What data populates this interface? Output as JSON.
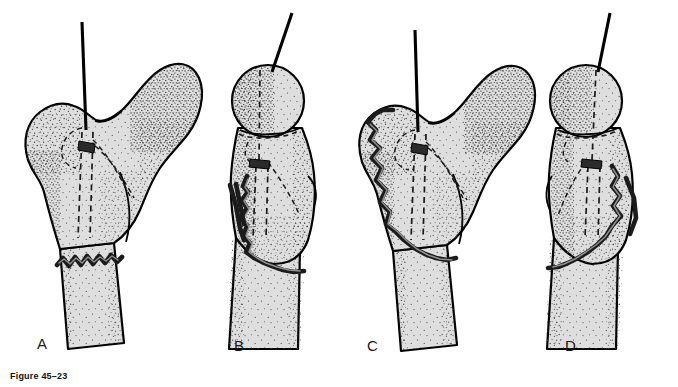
{
  "figure": {
    "caption": "Figure 45–23",
    "background_color": "#ffffff",
    "bone_fill_color": "#dedede",
    "outline_color": "#000000",
    "fracture_color": "#1b1b1b",
    "stipple_color": "#2a2a2a"
  },
  "panels": [
    {
      "id": "a",
      "label": "A",
      "label_x": 37,
      "label_y": 349,
      "view": "anteroposterior",
      "head_side": "right",
      "guide_pin": {
        "x": 82,
        "y_top": 22,
        "y_bottom": 130
      },
      "fracture": {
        "type": "transverse-comminuted",
        "location": "subtrochanteric-shaft"
      }
    },
    {
      "id": "b",
      "label": "B",
      "label_x": 234,
      "label_y": 351,
      "view": "lateral",
      "head_side": "top",
      "guide_pin": {
        "x": 292,
        "y_top": 13,
        "y_bottom": 78
      },
      "fracture": {
        "type": "oblique-comminuted",
        "location": "medial-subtrochanteric"
      }
    },
    {
      "id": "c",
      "label": "C",
      "label_x": 367,
      "label_y": 351,
      "view": "anteroposterior",
      "head_side": "right",
      "guide_pin": {
        "x": 415,
        "y_top": 30,
        "y_bottom": 130
      },
      "fracture": {
        "type": "long-oblique-comminuted",
        "location": "greater-trochanter-to-shaft"
      }
    },
    {
      "id": "d",
      "label": "D",
      "label_x": 565,
      "label_y": 351,
      "view": "lateral",
      "head_side": "top",
      "guide_pin": {
        "x": 610,
        "y_top": 13,
        "y_bottom": 78
      },
      "fracture": {
        "type": "oblique-comminuted",
        "location": "posterior-subtrochanteric"
      }
    }
  ]
}
